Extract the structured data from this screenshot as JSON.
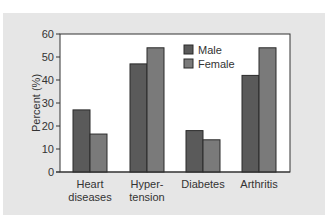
{
  "chart_data": {
    "type": "bar",
    "title": "",
    "xlabel": "",
    "ylabel": "Percent (%)",
    "ylim": [
      0,
      60
    ],
    "yticks": [
      0,
      10,
      20,
      30,
      40,
      50,
      60
    ],
    "grid": false,
    "legend_position": "top-center-inside",
    "categories": [
      "Heart diseases",
      "Hyper-tension",
      "Diabetes",
      "Arthritis"
    ],
    "category_labels": [
      [
        "Heart",
        "diseases"
      ],
      [
        "Hyper-",
        "tension"
      ],
      [
        "Diabetes"
      ],
      [
        "Arthritis"
      ]
    ],
    "series": [
      {
        "name": "Male",
        "color": "#5a5a5a",
        "values": [
          27,
          47,
          18,
          42
        ]
      },
      {
        "name": "Female",
        "color": "#7a7a7a",
        "values": [
          16.5,
          54,
          14,
          54
        ]
      }
    ]
  },
  "colors": {
    "panel": "#e6e6e6",
    "plot_bg": "#ffffff",
    "axis": "#333333"
  }
}
